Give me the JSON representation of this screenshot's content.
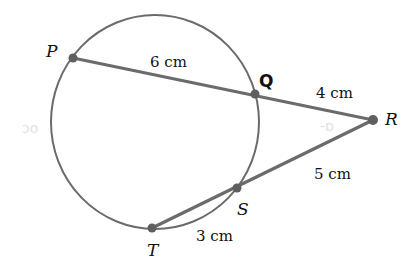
{
  "diagram": {
    "type": "circle-secant-theorem",
    "colors": {
      "stroke": "#6b6b6b",
      "point": "#5f5f5f",
      "text": "#111111",
      "background": "#ffffff"
    },
    "circle": {
      "cx": 155,
      "cy": 122,
      "rx": 104,
      "ry": 107
    },
    "points": {
      "P": {
        "label": "P",
        "x": 73,
        "y": 58
      },
      "Q": {
        "label": "Q",
        "x": 255,
        "y": 94
      },
      "R": {
        "label": "R",
        "x": 373,
        "y": 120
      },
      "S": {
        "label": "S",
        "x": 237,
        "y": 188
      },
      "T": {
        "label": "T",
        "x": 152,
        "y": 228
      }
    },
    "segments": {
      "PQ": {
        "label": "6 cm"
      },
      "QR": {
        "label": "4 cm"
      },
      "RS": {
        "label": "5 cm"
      },
      "ST": {
        "label": "3 cm"
      }
    },
    "ghost_marks": {
      "left": "ɔo",
      "inner": "-ɒ"
    }
  }
}
